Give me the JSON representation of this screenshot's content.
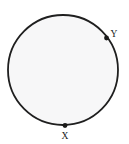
{
  "figure": {
    "type": "geometry-diagram",
    "canvas": {
      "width": 129,
      "height": 144,
      "background": "#ffffff"
    }
  },
  "shapes": {
    "circle": {
      "name": "circle",
      "cx": 63,
      "cy": 70,
      "r": 55,
      "stroke_color": "#1f1f1f",
      "stroke_width": 1.8,
      "fill_color": "#f7f7f8"
    }
  },
  "points": [
    {
      "id": "point-y",
      "label": "Y",
      "dot_x": 106.5,
      "dot_y": 38.0,
      "dot_r": 2.4,
      "dot_color": "#1a1a1a",
      "label_x": 114,
      "label_y": 37,
      "label_anchor": "middle"
    },
    {
      "id": "point-x",
      "label": "X",
      "dot_x": 65.0,
      "dot_y": 125.5,
      "dot_r": 2.4,
      "dot_color": "#1a1a1a",
      "label_x": 65,
      "label_y": 139,
      "label_anchor": "middle"
    }
  ],
  "chart_data": {
    "type": "scatter",
    "xlabel": "",
    "ylabel": "",
    "annotations": [
      "X",
      "Y"
    ],
    "categories": [
      "X",
      "Y"
    ],
    "values": [
      0,
      0
    ],
    "series": [
      {
        "name": "marked-points",
        "points": [
          {
            "label": "Y",
            "x": 106.5,
            "y": 38.0
          },
          {
            "label": "X",
            "x": 65.0,
            "y": 125.5
          }
        ]
      }
    ],
    "shapes": [
      {
        "kind": "circle",
        "cx": 63,
        "cy": 70,
        "r": 55
      }
    ],
    "grid": false,
    "legend": "none",
    "xlim": [
      0,
      129
    ],
    "ylim": [
      0,
      144
    ]
  }
}
